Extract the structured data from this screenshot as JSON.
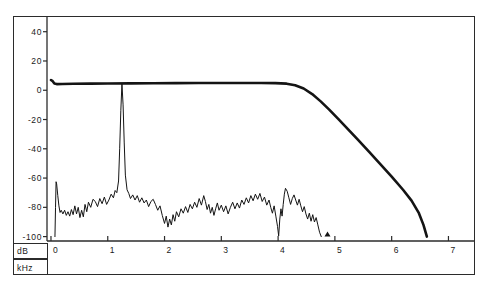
{
  "chart_data": {
    "type": "line",
    "title": "",
    "xlabel": "kHz",
    "ylabel": "dB",
    "xlim": [
      -0.07,
      7.45
    ],
    "ylim": [
      -103,
      48
    ],
    "xticks": [
      0,
      1,
      2,
      3,
      4,
      5,
      6,
      7
    ],
    "xticklabels": [
      "0",
      "1",
      "2",
      "3",
      "4",
      "5",
      "6",
      "7"
    ],
    "yticks": [
      40,
      20,
      0,
      -20,
      -40,
      -60,
      -80,
      -100
    ],
    "yticklabels": [
      "40",
      "20",
      "0",
      "-20",
      "-40",
      "-60",
      "-80",
      "-100"
    ],
    "grid": false,
    "legend": null,
    "annotations": [
      {
        "name": "cursor-marker",
        "x": 4.87,
        "y": -100,
        "glyph": "triangle-up"
      }
    ],
    "series": [
      {
        "name": "filter-response",
        "style": "thick-line",
        "color": "#141414",
        "linewidth": 2.6,
        "points": [
          [
            0.0,
            7.0
          ],
          [
            0.03,
            6.2
          ],
          [
            0.06,
            4.6
          ],
          [
            0.1,
            4.2
          ],
          [
            0.2,
            4.3
          ],
          [
            0.4,
            4.4
          ],
          [
            0.7,
            4.5
          ],
          [
            1.0,
            4.6
          ],
          [
            1.4,
            4.7
          ],
          [
            1.8,
            4.8
          ],
          [
            2.2,
            4.9
          ],
          [
            2.6,
            5.0
          ],
          [
            3.0,
            5.0
          ],
          [
            3.4,
            5.0
          ],
          [
            3.7,
            5.0
          ],
          [
            3.95,
            4.9
          ],
          [
            4.15,
            4.5
          ],
          [
            4.3,
            3.4
          ],
          [
            4.45,
            1.2
          ],
          [
            4.6,
            -2.6
          ],
          [
            4.75,
            -7.6
          ],
          [
            4.9,
            -13.2
          ],
          [
            5.05,
            -19.2
          ],
          [
            5.2,
            -25.4
          ],
          [
            5.4,
            -33.6
          ],
          [
            5.6,
            -42.0
          ],
          [
            5.8,
            -50.4
          ],
          [
            6.0,
            -59.0
          ],
          [
            6.2,
            -68.0
          ],
          [
            6.35,
            -75.4
          ],
          [
            6.48,
            -84.0
          ],
          [
            6.56,
            -92.0
          ],
          [
            6.62,
            -100.0
          ]
        ]
      },
      {
        "name": "noise-floor",
        "style": "thin-line",
        "color": "#141414",
        "linewidth": 1.0,
        "points": [
          [
            0.07,
            -100.0
          ],
          [
            0.08,
            -80.0
          ],
          [
            0.09,
            -62.5
          ],
          [
            0.1,
            -64.0
          ],
          [
            0.12,
            -72.0
          ],
          [
            0.14,
            -79.0
          ],
          [
            0.16,
            -83.5
          ],
          [
            0.18,
            -82.0
          ],
          [
            0.21,
            -84.5
          ],
          [
            0.24,
            -82.0
          ],
          [
            0.27,
            -85.5
          ],
          [
            0.3,
            -83.0
          ],
          [
            0.33,
            -86.0
          ],
          [
            0.36,
            -81.5
          ],
          [
            0.39,
            -85.0
          ],
          [
            0.42,
            -79.0
          ],
          [
            0.45,
            -84.5
          ],
          [
            0.48,
            -80.0
          ],
          [
            0.51,
            -87.0
          ],
          [
            0.54,
            -82.0
          ],
          [
            0.57,
            -86.5
          ],
          [
            0.6,
            -78.0
          ],
          [
            0.63,
            -83.0
          ],
          [
            0.66,
            -76.5
          ],
          [
            0.7,
            -80.0
          ],
          [
            0.74,
            -74.5
          ],
          [
            0.78,
            -76.0
          ],
          [
            0.82,
            -79.5
          ],
          [
            0.86,
            -74.0
          ],
          [
            0.9,
            -77.5
          ],
          [
            0.94,
            -73.0
          ],
          [
            0.98,
            -78.0
          ],
          [
            1.02,
            -75.0
          ],
          [
            1.06,
            -71.0
          ],
          [
            1.1,
            -73.5
          ],
          [
            1.13,
            -68.5
          ],
          [
            1.16,
            -70.0
          ],
          [
            1.19,
            -62.0
          ],
          [
            1.21,
            -40.0
          ],
          [
            1.23,
            -14.0
          ],
          [
            1.25,
            4.5
          ],
          [
            1.27,
            -10.0
          ],
          [
            1.29,
            -36.0
          ],
          [
            1.31,
            -58.0
          ],
          [
            1.34,
            -68.0
          ],
          [
            1.37,
            -70.5
          ],
          [
            1.4,
            -74.0
          ],
          [
            1.44,
            -71.5
          ],
          [
            1.48,
            -75.0
          ],
          [
            1.52,
            -72.0
          ],
          [
            1.56,
            -76.5
          ],
          [
            1.6,
            -73.5
          ],
          [
            1.64,
            -77.0
          ],
          [
            1.68,
            -75.0
          ],
          [
            1.72,
            -79.5
          ],
          [
            1.76,
            -76.0
          ],
          [
            1.8,
            -74.5
          ],
          [
            1.84,
            -78.0
          ],
          [
            1.88,
            -82.0
          ],
          [
            1.92,
            -79.0
          ],
          [
            1.96,
            -85.5
          ],
          [
            2.0,
            -91.0
          ],
          [
            2.03,
            -86.0
          ],
          [
            2.06,
            -93.5
          ],
          [
            2.09,
            -88.0
          ],
          [
            2.12,
            -92.0
          ],
          [
            2.15,
            -85.0
          ],
          [
            2.18,
            -89.5
          ],
          [
            2.21,
            -83.0
          ],
          [
            2.25,
            -86.5
          ],
          [
            2.29,
            -81.0
          ],
          [
            2.33,
            -84.0
          ],
          [
            2.37,
            -79.5
          ],
          [
            2.41,
            -83.5
          ],
          [
            2.45,
            -78.0
          ],
          [
            2.49,
            -81.0
          ],
          [
            2.53,
            -76.5
          ],
          [
            2.57,
            -80.0
          ],
          [
            2.61,
            -74.0
          ],
          [
            2.65,
            -78.5
          ],
          [
            2.69,
            -72.0
          ],
          [
            2.72,
            -76.0
          ],
          [
            2.75,
            -81.5
          ],
          [
            2.78,
            -78.0
          ],
          [
            2.81,
            -84.0
          ],
          [
            2.84,
            -80.0
          ],
          [
            2.87,
            -85.5
          ],
          [
            2.9,
            -81.0
          ],
          [
            2.93,
            -77.0
          ],
          [
            2.96,
            -82.0
          ],
          [
            3.0,
            -78.5
          ],
          [
            3.04,
            -83.0
          ],
          [
            3.08,
            -79.0
          ],
          [
            3.12,
            -84.5
          ],
          [
            3.16,
            -80.0
          ],
          [
            3.2,
            -76.5
          ],
          [
            3.24,
            -81.0
          ],
          [
            3.28,
            -77.0
          ],
          [
            3.32,
            -80.5
          ],
          [
            3.36,
            -75.0
          ],
          [
            3.4,
            -78.0
          ],
          [
            3.44,
            -73.5
          ],
          [
            3.48,
            -77.0
          ],
          [
            3.52,
            -72.0
          ],
          [
            3.56,
            -75.5
          ],
          [
            3.6,
            -71.0
          ],
          [
            3.64,
            -74.5
          ],
          [
            3.68,
            -70.5
          ],
          [
            3.72,
            -76.0
          ],
          [
            3.76,
            -73.0
          ],
          [
            3.8,
            -78.5
          ],
          [
            3.84,
            -75.0
          ],
          [
            3.87,
            -80.0
          ],
          [
            3.9,
            -84.0
          ],
          [
            3.93,
            -79.0
          ],
          [
            3.96,
            -86.0
          ],
          [
            3.99,
            -93.0
          ],
          [
            4.01,
            -99.5
          ],
          [
            4.03,
            -88.0
          ],
          [
            4.05,
            -81.0
          ],
          [
            4.07,
            -86.0
          ],
          [
            4.09,
            -78.0
          ],
          [
            4.11,
            -71.0
          ],
          [
            4.13,
            -67.0
          ],
          [
            4.16,
            -69.0
          ],
          [
            4.19,
            -73.5
          ],
          [
            4.22,
            -78.0
          ],
          [
            4.25,
            -74.0
          ],
          [
            4.28,
            -71.5
          ],
          [
            4.31,
            -75.0
          ],
          [
            4.34,
            -78.5
          ],
          [
            4.37,
            -74.5
          ],
          [
            4.4,
            -79.0
          ],
          [
            4.43,
            -83.0
          ],
          [
            4.46,
            -79.5
          ],
          [
            4.49,
            -84.5
          ],
          [
            4.52,
            -88.0
          ],
          [
            4.55,
            -84.0
          ],
          [
            4.58,
            -89.5
          ],
          [
            4.61,
            -85.0
          ],
          [
            4.64,
            -90.0
          ],
          [
            4.67,
            -87.0
          ],
          [
            4.7,
            -92.0
          ],
          [
            4.73,
            -97.0
          ],
          [
            4.76,
            -100.0
          ]
        ]
      }
    ]
  },
  "axes": {
    "y_unit_label": "dB",
    "x_unit_label": "kHz"
  }
}
